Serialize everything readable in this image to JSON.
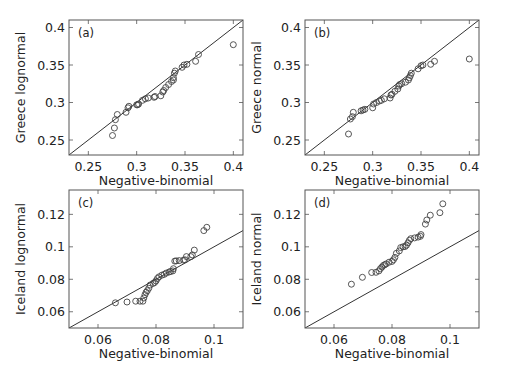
{
  "figure": {
    "width": 505,
    "height": 373,
    "colors": {
      "frame": "#555555",
      "line": "#333333",
      "marker": "#444444",
      "text": "#222222"
    }
  },
  "chart_data": [
    {
      "type": "scatter",
      "panel_label": "(a)",
      "title": "",
      "xlabel": "Negative-binomial",
      "ylabel": "Greece lognormal",
      "xlim": [
        0.23,
        0.41
      ],
      "ylim": [
        0.23,
        0.41
      ],
      "xticks": [
        0.25,
        0.3,
        0.35,
        0.4
      ],
      "xtick_labels": [
        "0.25",
        "0.3",
        "0.35",
        "0.4"
      ],
      "yticks": [
        0.25,
        0.3,
        0.35,
        0.4
      ],
      "ytick_labels": [
        "0.25",
        "0.3",
        "0.35",
        "0.4"
      ],
      "grid": false,
      "reference_line": {
        "label": "y = x",
        "from": [
          0.23,
          0.23
        ],
        "to": [
          0.41,
          0.41
        ]
      },
      "points": [
        [
          0.275,
          0.256
        ],
        [
          0.277,
          0.266
        ],
        [
          0.278,
          0.277
        ],
        [
          0.28,
          0.284
        ],
        [
          0.289,
          0.287
        ],
        [
          0.291,
          0.293
        ],
        [
          0.292,
          0.295
        ],
        [
          0.3,
          0.297
        ],
        [
          0.301,
          0.297
        ],
        [
          0.302,
          0.298
        ],
        [
          0.306,
          0.303
        ],
        [
          0.309,
          0.305
        ],
        [
          0.312,
          0.306
        ],
        [
          0.318,
          0.307
        ],
        [
          0.319,
          0.308
        ],
        [
          0.325,
          0.309
        ],
        [
          0.327,
          0.314
        ],
        [
          0.328,
          0.316
        ],
        [
          0.33,
          0.32
        ],
        [
          0.333,
          0.324
        ],
        [
          0.336,
          0.328
        ],
        [
          0.338,
          0.33
        ],
        [
          0.338,
          0.333
        ],
        [
          0.339,
          0.339
        ],
        [
          0.34,
          0.342
        ],
        [
          0.347,
          0.347
        ],
        [
          0.349,
          0.35
        ],
        [
          0.352,
          0.351
        ],
        [
          0.361,
          0.355
        ],
        [
          0.364,
          0.364
        ],
        [
          0.4,
          0.377
        ]
      ]
    },
    {
      "type": "scatter",
      "panel_label": "(b)",
      "title": "",
      "xlabel": "Negative-binomial",
      "ylabel": "Greece normal",
      "xlim": [
        0.23,
        0.41
      ],
      "ylim": [
        0.23,
        0.41
      ],
      "xticks": [
        0.25,
        0.3,
        0.35,
        0.4
      ],
      "xtick_labels": [
        "0.25",
        "0.3",
        "0.35",
        "0.4"
      ],
      "yticks": [
        0.25,
        0.3,
        0.35,
        0.4
      ],
      "ytick_labels": [
        "0.25",
        "0.3",
        "0.35",
        "0.4"
      ],
      "grid": false,
      "reference_line": {
        "label": "y = x",
        "from": [
          0.23,
          0.23
        ],
        "to": [
          0.41,
          0.41
        ]
      },
      "points": [
        [
          0.275,
          0.258
        ],
        [
          0.277,
          0.278
        ],
        [
          0.279,
          0.281
        ],
        [
          0.28,
          0.287
        ],
        [
          0.288,
          0.289
        ],
        [
          0.29,
          0.29
        ],
        [
          0.292,
          0.291
        ],
        [
          0.3,
          0.293
        ],
        [
          0.301,
          0.298
        ],
        [
          0.304,
          0.3
        ],
        [
          0.307,
          0.302
        ],
        [
          0.309,
          0.303
        ],
        [
          0.312,
          0.305
        ],
        [
          0.318,
          0.306
        ],
        [
          0.319,
          0.31
        ],
        [
          0.32,
          0.311
        ],
        [
          0.323,
          0.315
        ],
        [
          0.326,
          0.318
        ],
        [
          0.327,
          0.322
        ],
        [
          0.328,
          0.324
        ],
        [
          0.33,
          0.325
        ],
        [
          0.334,
          0.327
        ],
        [
          0.337,
          0.33
        ],
        [
          0.338,
          0.333
        ],
        [
          0.339,
          0.336
        ],
        [
          0.34,
          0.339
        ],
        [
          0.347,
          0.345
        ],
        [
          0.35,
          0.349
        ],
        [
          0.352,
          0.35
        ],
        [
          0.36,
          0.351
        ],
        [
          0.364,
          0.355
        ],
        [
          0.4,
          0.358
        ]
      ]
    },
    {
      "type": "scatter",
      "panel_label": "(c)",
      "title": "",
      "xlabel": "Negative-binomial",
      "ylabel": "Iceland lognormal",
      "xlim": [
        0.05,
        0.11
      ],
      "ylim": [
        0.05,
        0.135
      ],
      "xticks": [
        0.06,
        0.08,
        0.1
      ],
      "xtick_labels": [
        "0.06",
        "0.08",
        "0.1"
      ],
      "yticks": [
        0.06,
        0.08,
        0.1,
        0.12
      ],
      "ytick_labels": [
        "0.06",
        "0.08",
        "0.1",
        "0.12"
      ],
      "grid": false,
      "reference_line": {
        "label": "y = x",
        "from": [
          0.05,
          0.05
        ],
        "to": [
          0.11,
          0.11
        ]
      },
      "points": [
        [
          0.066,
          0.0655
        ],
        [
          0.07,
          0.066
        ],
        [
          0.073,
          0.0665
        ],
        [
          0.0745,
          0.0665
        ],
        [
          0.0755,
          0.0665
        ],
        [
          0.0758,
          0.0685
        ],
        [
          0.0762,
          0.0705
        ],
        [
          0.0766,
          0.072
        ],
        [
          0.077,
          0.073
        ],
        [
          0.0775,
          0.0745
        ],
        [
          0.078,
          0.0765
        ],
        [
          0.079,
          0.0775
        ],
        [
          0.0795,
          0.078
        ],
        [
          0.08,
          0.079
        ],
        [
          0.0805,
          0.0805
        ],
        [
          0.081,
          0.0815
        ],
        [
          0.082,
          0.0825
        ],
        [
          0.0828,
          0.083
        ],
        [
          0.0835,
          0.0838
        ],
        [
          0.0845,
          0.0845
        ],
        [
          0.085,
          0.0848
        ],
        [
          0.0858,
          0.0852
        ],
        [
          0.086,
          0.0865
        ],
        [
          0.0865,
          0.0912
        ],
        [
          0.087,
          0.0913
        ],
        [
          0.088,
          0.0915
        ],
        [
          0.0895,
          0.0918
        ],
        [
          0.09,
          0.092
        ],
        [
          0.0905,
          0.094
        ],
        [
          0.092,
          0.094
        ],
        [
          0.0925,
          0.095
        ],
        [
          0.0932,
          0.098
        ],
        [
          0.0965,
          0.11
        ],
        [
          0.0975,
          0.112
        ]
      ]
    },
    {
      "type": "scatter",
      "panel_label": "(d)",
      "title": "",
      "xlabel": "Negative-binomial",
      "ylabel": "Iceland normal",
      "xlim": [
        0.05,
        0.11
      ],
      "ylim": [
        0.05,
        0.135
      ],
      "xticks": [
        0.06,
        0.08,
        0.1
      ],
      "xtick_labels": [
        "0.06",
        "0.08",
        "0.1"
      ],
      "yticks": [
        0.06,
        0.08,
        0.1,
        0.12
      ],
      "ytick_labels": [
        "0.06",
        "0.08",
        "0.1",
        "0.12"
      ],
      "grid": false,
      "reference_line": {
        "label": "y = x",
        "from": [
          0.05,
          0.05
        ],
        "to": [
          0.11,
          0.11
        ]
      },
      "points": [
        [
          0.066,
          0.077
        ],
        [
          0.0698,
          0.0812
        ],
        [
          0.073,
          0.0842
        ],
        [
          0.0745,
          0.0843
        ],
        [
          0.0755,
          0.0852
        ],
        [
          0.076,
          0.0865
        ],
        [
          0.0765,
          0.0875
        ],
        [
          0.077,
          0.0885
        ],
        [
          0.0775,
          0.089
        ],
        [
          0.078,
          0.0895
        ],
        [
          0.079,
          0.0905
        ],
        [
          0.08,
          0.091
        ],
        [
          0.0805,
          0.092
        ],
        [
          0.081,
          0.0935
        ],
        [
          0.0815,
          0.096
        ],
        [
          0.0825,
          0.0975
        ],
        [
          0.083,
          0.0995
        ],
        [
          0.0838,
          0.1
        ],
        [
          0.0845,
          0.1002
        ],
        [
          0.085,
          0.101
        ],
        [
          0.0855,
          0.1025
        ],
        [
          0.086,
          0.104
        ],
        [
          0.0865,
          0.105
        ],
        [
          0.0878,
          0.1055
        ],
        [
          0.089,
          0.106
        ],
        [
          0.0898,
          0.1065
        ],
        [
          0.09,
          0.1075
        ],
        [
          0.0915,
          0.114
        ],
        [
          0.092,
          0.1165
        ],
        [
          0.0932,
          0.1195
        ],
        [
          0.0965,
          0.121
        ],
        [
          0.0975,
          0.1265
        ]
      ]
    }
  ]
}
